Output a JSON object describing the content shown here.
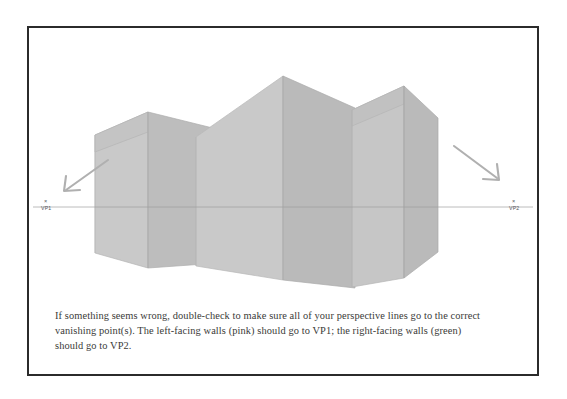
{
  "figure": {
    "frame_border_color": "#2b2b2b",
    "background_color": "#ffffff",
    "horizon": {
      "label": "horizon-line",
      "y": 207,
      "color": "#b4b4b4",
      "x_start": 33,
      "x_end": 533
    },
    "vanishing_points": [
      {
        "id": "VP1",
        "label": "VP1",
        "marker": "×",
        "x": 47,
        "y": 207,
        "side": "left",
        "associated_walls": "left-facing walls (pink)"
      },
      {
        "id": "VP2",
        "label": "VP2",
        "marker": "×",
        "x": 515,
        "y": 207,
        "side": "right",
        "associated_walls": "right-facing walls (green)"
      }
    ],
    "arrows": [
      {
        "id": "arrow-to-vp1",
        "direction": "down-left",
        "color": "#b0b0b0",
        "from_x": 108,
        "from_y": 160,
        "to_x": 64,
        "to_y": 191
      },
      {
        "id": "arrow-to-vp2",
        "direction": "down-right",
        "color": "#b0b0b0",
        "from_x": 454,
        "from_y": 146,
        "to_x": 500,
        "to_y": 180
      }
    ],
    "colors": {
      "left_facing_wall": "#c9c9c9",
      "right_facing_wall": "#bbbbbb",
      "roof_left": "#c4c4c4",
      "roof_right": "#b6b6b6",
      "edge_line": "#a9a9a9",
      "horizon_line": "#b4b4b4",
      "arrow": "#b0b0b0"
    },
    "buildings": [
      {
        "id": "building-left",
        "name": "left-building",
        "description": "lower gabled block at far left, peak below the others"
      },
      {
        "id": "building-center",
        "name": "center-building",
        "description": "tallest gabled block in the middle"
      },
      {
        "id": "building-right",
        "name": "right-building",
        "description": "gabled block on the right, slightly lower than center"
      }
    ]
  },
  "caption": {
    "text": "If something seems wrong, double-check to make sure all of your perspective lines go to the correct vanishing point(s). The left-facing walls (pink) should go to VP1; the right-facing walls (green) should go to VP2."
  }
}
